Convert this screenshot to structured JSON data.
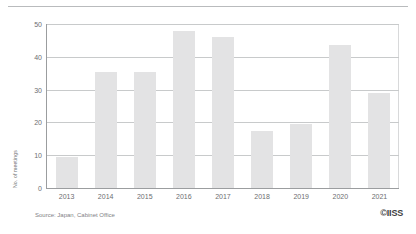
{
  "chart_data": {
    "type": "bar",
    "title": "",
    "xlabel": "",
    "ylabel": "No. of meetings",
    "categories": [
      "2013",
      "2014",
      "2015",
      "2016",
      "2017",
      "2018",
      "2019",
      "2020",
      "2021"
    ],
    "values": [
      9.5,
      35.5,
      35.5,
      48,
      46,
      17.5,
      19.5,
      43.5,
      29
    ],
    "ylim": [
      0,
      50
    ],
    "yticks": [
      0,
      10,
      20,
      30,
      40,
      50
    ],
    "ytick_labels": [
      "0",
      "10",
      "20",
      "30",
      "40",
      "50"
    ],
    "grid": true,
    "legend": null,
    "bar_color": "#e3e3e4",
    "axis_color": "#9b9d9f",
    "grid_color": "#c8cacb",
    "text_color": "#6d6e71"
  },
  "footer": {
    "source": "Source: Japan, Cabinet Office",
    "logo": "©IISS"
  }
}
